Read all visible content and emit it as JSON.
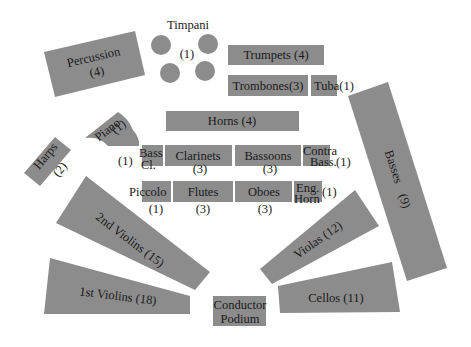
{
  "colors": {
    "section_fill": "#8c8c8c",
    "text": "#1a1a1a",
    "background": "#ffffff"
  },
  "sections": {
    "timpani": {
      "name": "Timpani",
      "count": "(1)"
    },
    "percussion": {
      "name": "Percussion",
      "count": "(4)"
    },
    "trumpets": {
      "name": "Trumpets",
      "count": "(4)",
      "label": "Trumpets (4)"
    },
    "trombones": {
      "name": "Trombones",
      "count": "(3)",
      "label": "Trombones(3)"
    },
    "tuba": {
      "name": "Tuba",
      "count": "(1)",
      "label": "Tuba(1)"
    },
    "piano": {
      "name": "Piano",
      "count": "(1)"
    },
    "horns": {
      "name": "Horns",
      "count": "(4)",
      "label": "Horns  (4)"
    },
    "harps": {
      "name": "Harps",
      "count": "(2)"
    },
    "bass_clarinet": {
      "name_line1": "Bass",
      "name_line2": "Cl.",
      "count": "(1)"
    },
    "clarinets": {
      "name": "Clarinets",
      "count": "(3)"
    },
    "bassoons": {
      "name": "Bassoons",
      "count": "(3)"
    },
    "contrabass": {
      "name_line1": "Contra",
      "name_line2": "Bass.",
      "count": "(1)"
    },
    "piccolo": {
      "name": "Piccolo",
      "count": "(1)"
    },
    "flutes": {
      "name": "Flutes",
      "count": "(3)"
    },
    "oboes": {
      "name": "Oboes",
      "count": "(3)"
    },
    "english_horn": {
      "name_line1": "Eng.",
      "name_line2": "Horn",
      "count": "(1)"
    },
    "basses": {
      "name": "Basses",
      "count": "(9)"
    },
    "second_violins": {
      "name": "2nd Violins",
      "count": "(15)",
      "label": "2nd Violins  (15)"
    },
    "violas": {
      "name": "Violas",
      "count": "(12)",
      "label": "Violas (12)"
    },
    "first_violins": {
      "name": "1st Violins",
      "count": "(18)",
      "label": "1st Violins   (18)"
    },
    "cellos": {
      "name": "Cellos",
      "count": "(11)",
      "label": "Cellos  (11)"
    },
    "conductor": {
      "name_line1": "Conductor",
      "name_line2": "Podium"
    }
  }
}
